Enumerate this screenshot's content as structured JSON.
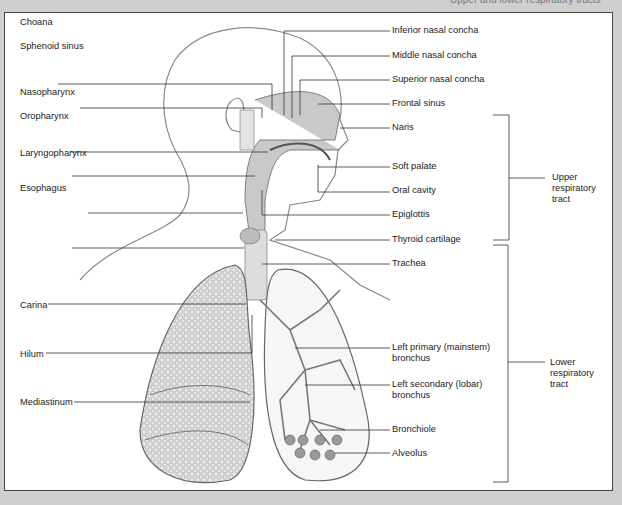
{
  "figure": {
    "title_partial": "Upper and lower respiratory tracts",
    "left_labels": [
      {
        "text": "Choana",
        "x": 20,
        "y": 17
      },
      {
        "text": "Sphenoid sinus",
        "x": 20,
        "y": 41
      },
      {
        "text": "Nasopharynx",
        "x": 20,
        "y": 87
      },
      {
        "text": "Oropharynx",
        "x": 20,
        "y": 111
      },
      {
        "text": "Laryngopharynx",
        "x": 20,
        "y": 148
      },
      {
        "text": "Esophagus",
        "x": 20,
        "y": 183
      },
      {
        "text": "Carina",
        "x": 20,
        "y": 300
      },
      {
        "text": "Hilum",
        "x": 20,
        "y": 349
      },
      {
        "text": "Mediastinum",
        "x": 20,
        "y": 397
      }
    ],
    "right_labels": [
      {
        "text": "Inferior nasal concha",
        "x": 392,
        "y": 25
      },
      {
        "text": "Middle nasal concha",
        "x": 392,
        "y": 50
      },
      {
        "text": "Superior nasal concha",
        "x": 392,
        "y": 74
      },
      {
        "text": "Frontal sinus",
        "x": 392,
        "y": 98
      },
      {
        "text": "Naris",
        "x": 392,
        "y": 122
      },
      {
        "text": "Soft palate",
        "x": 392,
        "y": 161
      },
      {
        "text": "Oral cavity",
        "x": 392,
        "y": 185
      },
      {
        "text": "Epiglottis",
        "x": 392,
        "y": 209
      },
      {
        "text": "Thyroid cartilage",
        "x": 392,
        "y": 234
      },
      {
        "text": "Trachea",
        "x": 392,
        "y": 258
      },
      {
        "text": "Left primary (mainstem)\nbronchus",
        "x": 392,
        "y": 342
      },
      {
        "text": "Left secondary (lobar)\nbronchus",
        "x": 392,
        "y": 379
      },
      {
        "text": "Bronchiole",
        "x": 392,
        "y": 424
      },
      {
        "text": "Alveolus",
        "x": 392,
        "y": 448
      }
    ],
    "groups": [
      {
        "text": "Upper\nrespiratory\ntract",
        "x": 552,
        "y": 172
      },
      {
        "text": "Lower\nrespiratory\ntract",
        "x": 550,
        "y": 357
      }
    ]
  }
}
